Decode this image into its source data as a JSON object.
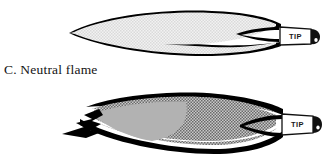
{
  "document": {
    "kind": "scanned-textbook-figure",
    "subject": "Oxy-acetylene flame types"
  },
  "colors": {
    "ink": "#000000",
    "paper": "#ffffff",
    "caption_text": "#141414",
    "neutral_fill": "#ededed",
    "neutral_stipple": "#d8d8d8",
    "oxidizing_inner_fill": "#b4b4b4",
    "oxidizing_outer_fill": "#9a9a9a",
    "oxidizing_checker": "#6f6f6f",
    "tip_box_fill": "#ffffff",
    "nozzle_fill": "#111111"
  },
  "figures": [
    {
      "id": "neutral",
      "letter": "C.",
      "name": "Neutral flame",
      "caption": "C. Neutral flame",
      "tip_label": "TIP",
      "envelope_shape": "long slender pointed ellipse",
      "inner_cone": "small sharp cone at torch end",
      "left_tip": "smooth sharp point",
      "fill_style": "light fine stipple"
    },
    {
      "id": "oxidizing",
      "letter": "D.",
      "name": "Oxidizing flame",
      "caption": "D. Oxidizing flame",
      "caption_clipped": true,
      "tip_label": "TIP",
      "envelope_shape": "short blunt rounded ellipse",
      "inner_cone": "short gray cone with ragged spur",
      "left_tip": "ragged jagged point with spur",
      "fill_style": "dark checkerboard halftone over gray cone"
    }
  ],
  "torch": {
    "tip_label": "TIP",
    "nozzle_icon": "torch-nozzle-icon",
    "count": 2
  }
}
